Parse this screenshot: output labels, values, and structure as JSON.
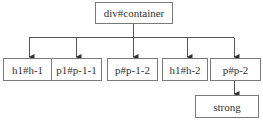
{
  "diagram": {
    "type": "tree",
    "root": {
      "id": "root",
      "label": "div#container"
    },
    "children": [
      {
        "id": "h1-h-1",
        "label": "h1#h-1"
      },
      {
        "id": "p1-p-1-1",
        "label": "p1#p-1-1"
      },
      {
        "id": "p-p-1-2",
        "label": "p#p-1-2"
      },
      {
        "id": "h1-h-2",
        "label": "h1#h-2"
      },
      {
        "id": "p-p-2",
        "label": "p#p-2",
        "children": [
          {
            "id": "strong",
            "label": "strong"
          }
        ]
      }
    ],
    "colors": {
      "line": "#555555",
      "border": "#7a7a7a",
      "text": "#333333"
    }
  }
}
